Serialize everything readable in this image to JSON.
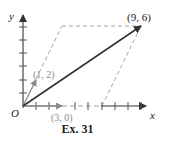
{
  "figure": {
    "caption": "Ex. 31",
    "axes": {
      "x_label": "x",
      "y_label": "y",
      "origin_label": "O"
    },
    "vectors": [
      {
        "label": "(1, 2)",
        "from": [
          0,
          0
        ],
        "to": [
          1,
          2
        ],
        "color": "#8a8a8a"
      },
      {
        "label": "(3, 0)",
        "from": [
          0,
          0
        ],
        "to": [
          3,
          0
        ],
        "color": "#8a8a8a"
      },
      {
        "label": "(9, 6)",
        "from": [
          0,
          0
        ],
        "to": [
          9,
          6
        ],
        "color": "#333333"
      }
    ],
    "dashed_lines": [
      {
        "from": [
          1,
          2
        ],
        "to": [
          3,
          6
        ]
      },
      {
        "from": [
          3,
          6
        ],
        "to": [
          9,
          6
        ]
      },
      {
        "from": [
          3,
          0
        ],
        "to": [
          6,
          0
        ]
      },
      {
        "from": [
          6,
          0
        ],
        "to": [
          9,
          6
        ]
      }
    ],
    "x_ticks": [
      1,
      2,
      3,
      4,
      5,
      6,
      7,
      8,
      9,
      10,
      11
    ],
    "y_ticks": [
      1,
      2,
      3,
      4,
      5,
      6
    ],
    "colors": {
      "primary": "#333333",
      "secondary": "#8a8a8a",
      "dashed": "#999999"
    }
  }
}
